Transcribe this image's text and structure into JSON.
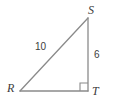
{
  "figure": {
    "type": "right-triangle",
    "name": "triangle-RST",
    "background_color": "#ffffff",
    "stroke_color": "#8a8a8a",
    "text_color": "#3c3c3c",
    "stroke_width": 1.3,
    "vertices": [
      {
        "id": "R",
        "label": "R",
        "x": 20,
        "y": 91,
        "label_x": 7,
        "label_y": 82
      },
      {
        "id": "S",
        "label": "S",
        "x": 88,
        "y": 18,
        "label_x": 88,
        "label_y": 4
      },
      {
        "id": "T",
        "label": "T",
        "x": 88,
        "y": 91,
        "label_x": 92,
        "label_y": 85
      }
    ],
    "sides": [
      {
        "id": "RS",
        "from": "R",
        "to": "S",
        "label": "10",
        "label_x": 35,
        "label_y": 42
      },
      {
        "id": "ST",
        "from": "S",
        "to": "T",
        "label": "6",
        "label_x": 94,
        "label_y": 50
      },
      {
        "id": "RT",
        "from": "R",
        "to": "T",
        "label": ""
      }
    ],
    "right_angle": {
      "at_vertex": "T",
      "marker": "square",
      "x": 80,
      "y": 83,
      "size": 8
    }
  }
}
